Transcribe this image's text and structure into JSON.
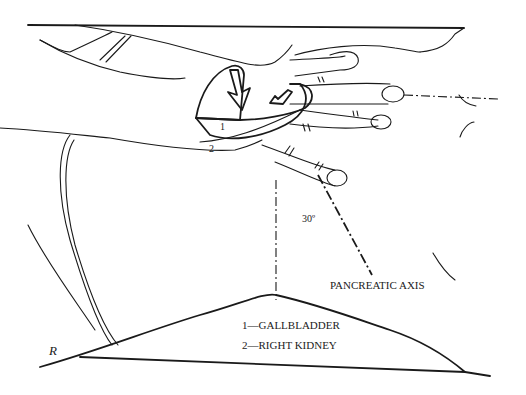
{
  "figure": {
    "organ_labels": {
      "label_1": "1",
      "label_2": "2"
    },
    "angle_label": "30º",
    "axis_label": "PANCREATIC AXIS",
    "legend": [
      {
        "text": "1—GALLBLADDER"
      },
      {
        "text": "2—RIGHT KIDNEY"
      }
    ],
    "signature": "R"
  }
}
